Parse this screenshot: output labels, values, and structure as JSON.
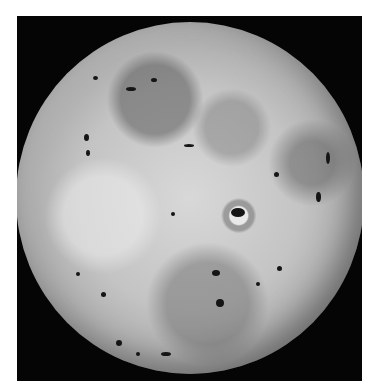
{
  "image": {
    "subject": "Grayscale photograph of a volcanic moon disk on black background",
    "alt": "Io",
    "background_color": "#ffffff",
    "frame_color": "#050505",
    "disk_base_color": "#c4c4c4",
    "spot_color": "#151515"
  }
}
